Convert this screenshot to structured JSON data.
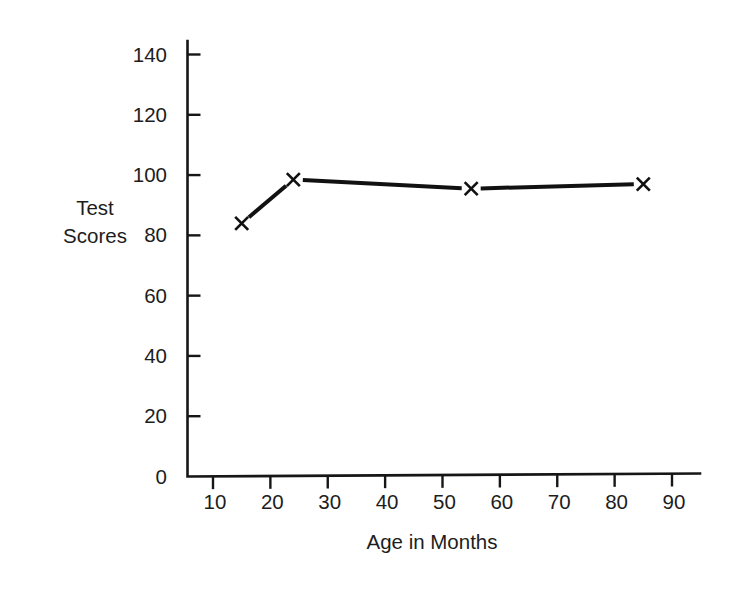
{
  "chart_data": {
    "type": "line",
    "title": "",
    "xlabel": "Age in Months",
    "ylabel": "Test Scores",
    "ylabel_line1": "Test",
    "ylabel_line2": "Scores",
    "x": [
      15,
      24,
      55,
      85
    ],
    "values": [
      84,
      98.5,
      95.5,
      97
    ],
    "series": [
      {
        "name": "Test Scores",
        "x": [
          15,
          24,
          55,
          85
        ],
        "values": [
          84,
          98.5,
          95.5,
          97
        ],
        "marker": "x",
        "color": "#111111"
      }
    ],
    "xlim": [
      0,
      99
    ],
    "ylim": [
      0,
      145
    ],
    "x_ticks": [
      10,
      20,
      30,
      40,
      50,
      60,
      70,
      80,
      90
    ],
    "x_tick_labels": [
      "10",
      "20",
      "30",
      "40",
      "50",
      "60",
      "70",
      "80",
      "90"
    ],
    "y_ticks": [
      0,
      20,
      40,
      60,
      80,
      100,
      120,
      140
    ],
    "y_tick_labels": [
      "0",
      "20",
      "40",
      "60",
      "80",
      "100",
      "120",
      "140"
    ],
    "grid": false,
    "legend": "none",
    "background_color": "#ffffff",
    "axis_color": "#161616"
  }
}
